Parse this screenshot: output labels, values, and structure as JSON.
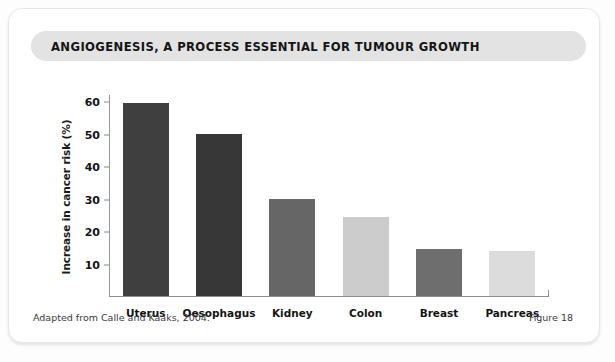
{
  "card": {
    "title": "ANGIOGENESIS, A PROCESS ESSENTIAL FOR TUMOUR GROWTH",
    "banner_color": "#e3e3e3",
    "background_color": "#ffffff"
  },
  "footer": {
    "source": "Adapted from Calle and Kaaks, 2004.",
    "figure_number": "Figure 18"
  },
  "chart_data": {
    "type": "bar",
    "title": "ANGIOGENESIS, A PROCESS ESSENTIAL FOR TUMOUR GROWTH",
    "xlabel": "",
    "ylabel": "Increase in cancer risk (%)",
    "categories": [
      "Uterus",
      "Oesophagus",
      "Kidney",
      "Colon",
      "Breast",
      "Pancreas"
    ],
    "values": [
      59.5,
      50,
      30,
      24.5,
      14.5,
      14
    ],
    "bar_colors": [
      "#3f3f3f",
      "#373737",
      "#666666",
      "#cccccc",
      "#6e6e6e",
      "#dcdcdc"
    ],
    "ylim": [
      0,
      62
    ],
    "yticks": [
      10,
      20,
      30,
      40,
      50,
      60
    ],
    "ytick_labels": [
      "10",
      "20",
      "30",
      "40",
      "50",
      "60"
    ],
    "grid": false,
    "legend": "none",
    "source_note": "Adapted from Calle and Kaaks, 2004."
  }
}
